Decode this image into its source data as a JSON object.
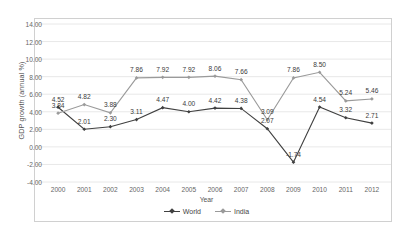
{
  "chart_data": {
    "type": "line",
    "title": "",
    "xlabel": "Year",
    "ylabel": "GDP growth (annual  %)",
    "categories": [
      "2000",
      "2001",
      "2002",
      "2003",
      "2004",
      "2005",
      "2006",
      "2007",
      "2008",
      "2009",
      "2010",
      "2011",
      "2012"
    ],
    "ylim": [
      -4.0,
      14.0
    ],
    "ytick_step": 2.0,
    "yticks": [
      "14.00",
      "12.00",
      "10.00",
      "8.00",
      "6.00",
      "4.00",
      "2.00",
      "0.00",
      "-2.00",
      "-4.00"
    ],
    "ytick_values": [
      14.0,
      12.0,
      10.0,
      8.0,
      6.0,
      4.0,
      2.0,
      0.0,
      -2.0,
      -4.0
    ],
    "grid": "horizontal",
    "legend_position": "bottom",
    "series": [
      {
        "name": "World",
        "color": "#404040",
        "marker": "diamond",
        "values": [
          4.52,
          2.01,
          2.3,
          3.11,
          4.47,
          4.0,
          4.42,
          4.38,
          2.07,
          -1.74,
          4.54,
          3.32,
          2.71
        ],
        "labels": [
          "4.52",
          "2.01",
          "2.30",
          "3.11",
          "4.47",
          "4.00",
          "4.42",
          "4.38",
          "2.07",
          "-1.74",
          "4.54",
          "3.32",
          "2.71"
        ]
      },
      {
        "name": "India",
        "color": "#9a9a9a",
        "marker": "diamond",
        "values": [
          3.84,
          4.82,
          3.88,
          7.86,
          7.92,
          7.92,
          8.06,
          7.66,
          3.09,
          7.86,
          8.5,
          5.24,
          5.46
        ],
        "labels": [
          "3.84",
          "4.82",
          "3.88",
          "7.86",
          "7.92",
          "7.92",
          "8.06",
          "7.66",
          "3.09",
          "7.86",
          "8.50",
          "5.24",
          "5.46"
        ]
      }
    ]
  },
  "legend": {
    "items": [
      {
        "label": "World"
      },
      {
        "label": "India"
      }
    ]
  },
  "axis": {
    "x_title": "Year",
    "y_title": "GDP growth (annual  %)"
  }
}
